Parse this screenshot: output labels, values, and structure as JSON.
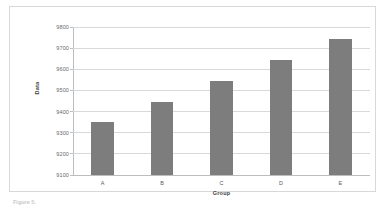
{
  "figure": {
    "border_color": "#d8d8d8",
    "background": "#ffffff",
    "caption_partial": "Figure 5."
  },
  "chart_data": {
    "type": "bar",
    "title": "",
    "subtitle": "",
    "xlabel": "Group",
    "ylabel": "Data",
    "categories": [
      "A",
      "B",
      "C",
      "D",
      "E"
    ],
    "values": [
      9350,
      9445,
      9545,
      9645,
      9745
    ],
    "ylim": [
      9100,
      9800
    ],
    "ytick_step": 100,
    "ytick_labels": [
      "9100",
      "9200",
      "9300",
      "9400",
      "9500",
      "9600",
      "9700",
      "9800"
    ],
    "ytick_values": [
      9100,
      9200,
      9300,
      9400,
      9500,
      9600,
      9700,
      9800
    ],
    "grid": true,
    "grid_axis": "y",
    "grid_color": "#d9d9d9",
    "legend": false,
    "legend_position": "none",
    "bar_color": "#7d7d7d",
    "bar_edge_color": "#7d7d7d",
    "axis_color": "#bdbdbd",
    "plot_background": "#ffffff"
  }
}
